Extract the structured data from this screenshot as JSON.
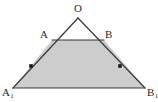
{
  "figure": {
    "kind": "geometry-diagram",
    "background_color": "#ffffff",
    "stroke_color": "#3a3a3a",
    "shaded_fill_color": "#cdcdcd",
    "unshaded_fill_color": "#ffffff",
    "tick_color": "#1a1a1a",
    "labels": {
      "apex": "O",
      "left_inner": "A",
      "right_inner": "B",
      "left_base": "A",
      "left_base_subscript": "1",
      "right_base": "B",
      "right_base_subscript": "1"
    },
    "points": {
      "O": {
        "x": 78,
        "y": 18
      },
      "A": {
        "x": 52,
        "y": 40
      },
      "B": {
        "x": 104,
        "y": 40
      },
      "A1": {
        "x": 13,
        "y": 88
      },
      "B1": {
        "x": 145,
        "y": 88
      }
    },
    "segments": [
      {
        "name": "O-A1",
        "from": "O",
        "to": "A1"
      },
      {
        "name": "O-B1",
        "from": "O",
        "to": "B1"
      },
      {
        "name": "A-B",
        "from": "A",
        "to": "B"
      },
      {
        "name": "A1-B1",
        "from": "A1",
        "to": "B1"
      }
    ],
    "tick_marks": [
      {
        "name": "left-leg-tick",
        "x": 31,
        "y": 66,
        "size": 3.6
      },
      {
        "name": "right-leg-tick",
        "x": 120,
        "y": 66,
        "size": 3.6
      }
    ]
  }
}
